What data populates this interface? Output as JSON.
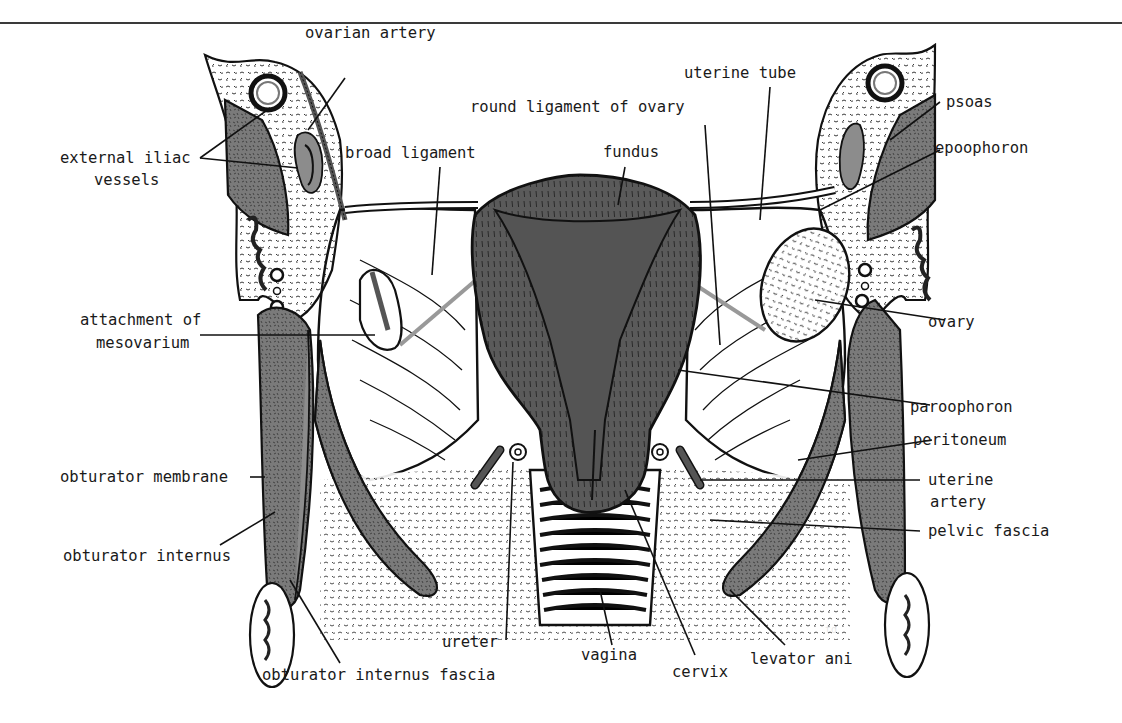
{
  "figure": {
    "signature": "td"
  },
  "labels": {
    "ovarian_artery": "ovarian artery",
    "external_iliac_line1": "external iliac",
    "external_iliac_line2": "vessels",
    "broad_ligament": "broad ligament",
    "round_ligament_of_ovary": "round ligament of ovary",
    "fundus": "fundus",
    "uterine_tube": "uterine tube",
    "psoas": "psoas",
    "epoophoron": "epoophoron",
    "attachment_line1": "attachment of",
    "attachment_line2": "mesovarium",
    "ovary": "ovary",
    "paroophoron": "paroophoron",
    "peritoneum": "peritoneum",
    "uterine_artery_line1": "uterine",
    "uterine_artery_line2": "artery",
    "obturator_membrane": "obturator membrane",
    "pelvic_fascia": "pelvic fascia",
    "obturator_internus": "obturator internus",
    "ureter": "ureter",
    "vagina": "vagina",
    "cervix": "cervix",
    "levator_ani": "levator ani",
    "obturator_internus_fascia": "obturator internus fascia"
  },
  "colors": {
    "uterus_fill": "#5a5a5a",
    "line": "#111111",
    "background": "#ffffff"
  }
}
